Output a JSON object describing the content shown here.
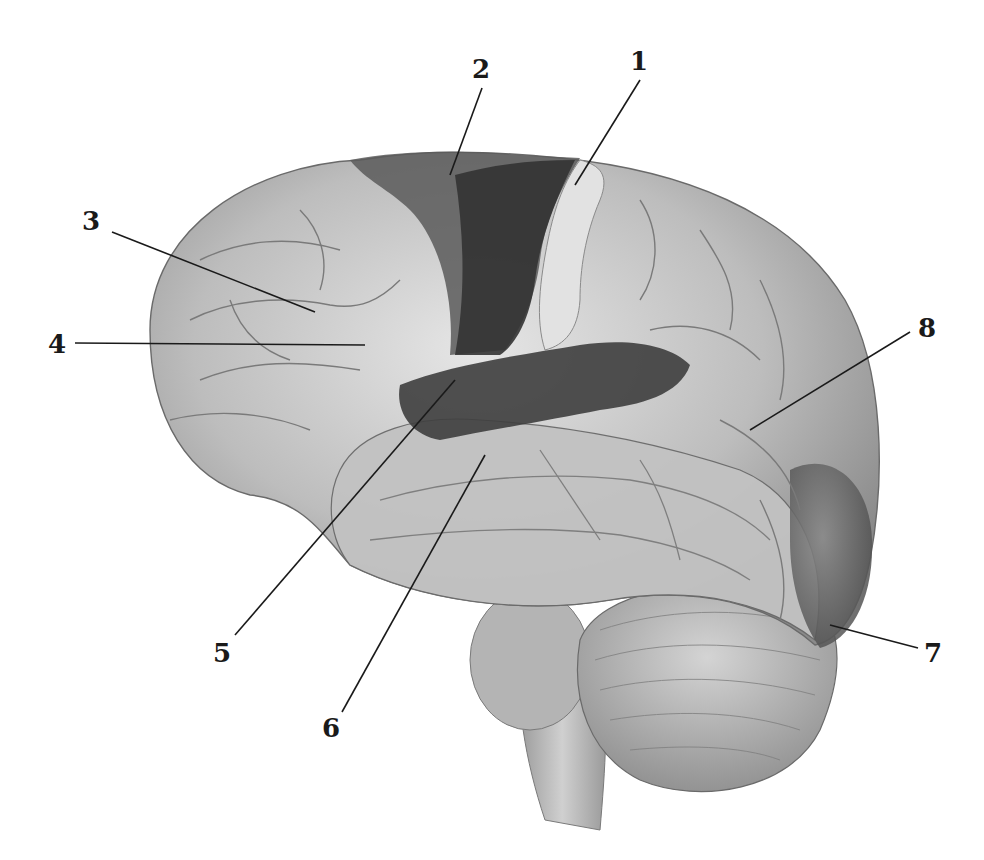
{
  "figure": {
    "style": "grayscale anatomical illustration",
    "colors": {
      "background": "#ffffff",
      "cortex_light": "#d8d8d8",
      "cortex_mid": "#a8a8a8",
      "highlight_dark": "#3a3a3a",
      "highlight_mid": "#6a6a6a",
      "label": "#1a1a1a"
    },
    "labels": [
      {
        "id": "1",
        "text": "1",
        "x": 630,
        "y": 70,
        "target": [
          575,
          185
        ]
      },
      {
        "id": "2",
        "text": "2",
        "x": 480,
        "y": 78,
        "target": [
          450,
          175
        ]
      },
      {
        "id": "3",
        "text": "3",
        "x": 90,
        "y": 228,
        "target": [
          315,
          312
        ]
      },
      {
        "id": "4",
        "text": "4",
        "x": 55,
        "y": 352,
        "target": [
          365,
          345
        ]
      },
      {
        "id": "5",
        "text": "5",
        "x": 220,
        "y": 660,
        "target": [
          455,
          380
        ]
      },
      {
        "id": "6",
        "text": "6",
        "x": 330,
        "y": 735,
        "target": [
          485,
          455
        ]
      },
      {
        "id": "7",
        "text": "7",
        "x": 930,
        "y": 660,
        "target": [
          830,
          625
        ]
      },
      {
        "id": "8",
        "text": "8",
        "x": 925,
        "y": 335,
        "target": [
          750,
          430
        ]
      }
    ]
  }
}
